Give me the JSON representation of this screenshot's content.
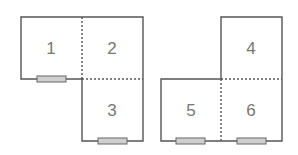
{
  "figures": [
    {
      "name": "left-layout",
      "rooms": [
        {
          "label": "1"
        },
        {
          "label": "2"
        },
        {
          "label": "3"
        }
      ]
    },
    {
      "name": "right-layout",
      "rooms": [
        {
          "label": "4"
        },
        {
          "label": "5"
        },
        {
          "label": "6"
        }
      ]
    }
  ],
  "colors": {
    "wall": "#555555",
    "door_fill": "#cfcfcf",
    "label": "#777777"
  }
}
